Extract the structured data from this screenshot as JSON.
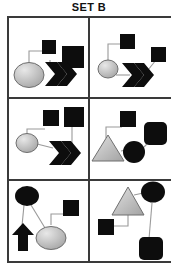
{
  "title": "SET B",
  "figure": {
    "type": "diagram",
    "grid": {
      "rows": 3,
      "columns": 2,
      "panel_count": 6
    },
    "colors": {
      "background": "#ffffff",
      "frame": "#3a3a3a",
      "shape_black": "#0d0d0d",
      "shape_gray": "#b4b4b4",
      "shape_gray_highlight": "#e6e6e6",
      "link": "#9a9a9a",
      "title_text": "#111111"
    },
    "panels": [
      {
        "id": "panel-1",
        "position": "top-left",
        "shapes": [
          {
            "name": "gray-circle",
            "shape": "circle",
            "fill": "gray"
          },
          {
            "name": "small-black-square",
            "shape": "square",
            "fill": "black",
            "size": "small"
          },
          {
            "name": "large-black-square",
            "shape": "square",
            "fill": "black",
            "size": "large"
          },
          {
            "name": "black-chevron",
            "shape": "chevron",
            "fill": "black"
          }
        ],
        "links": [
          {
            "from": "gray-circle",
            "to": "small-black-square",
            "style": "elbow"
          },
          {
            "from": "small-black-square",
            "to": "large-black-square",
            "style": "elbow"
          },
          {
            "from": "large-black-square",
            "to": "black-chevron",
            "style": "straight"
          }
        ]
      },
      {
        "id": "panel-2",
        "position": "top-right",
        "shapes": [
          {
            "name": "gray-circle",
            "shape": "circle",
            "fill": "gray"
          },
          {
            "name": "small-black-square-top",
            "shape": "square",
            "fill": "black",
            "size": "small"
          },
          {
            "name": "small-black-square-right",
            "shape": "square",
            "fill": "black",
            "size": "small"
          },
          {
            "name": "black-chevron",
            "shape": "chevron",
            "fill": "black"
          }
        ],
        "links": [
          {
            "from": "gray-circle",
            "to": "small-black-square-top",
            "style": "elbow"
          },
          {
            "from": "gray-circle",
            "to": "black-chevron",
            "style": "straight"
          },
          {
            "from": "black-chevron",
            "to": "small-black-square-right",
            "style": "straight"
          }
        ]
      },
      {
        "id": "panel-3",
        "position": "middle-left",
        "shapes": [
          {
            "name": "gray-circle",
            "shape": "circle",
            "fill": "gray"
          },
          {
            "name": "small-black-square",
            "shape": "square",
            "fill": "black",
            "size": "small"
          },
          {
            "name": "large-black-square",
            "shape": "square",
            "fill": "black",
            "size": "large"
          },
          {
            "name": "black-chevron",
            "shape": "chevron",
            "fill": "black"
          }
        ],
        "links": [
          {
            "from": "gray-circle",
            "to": "small-black-square",
            "style": "elbow"
          },
          {
            "from": "large-black-square",
            "to": "black-chevron",
            "style": "straight"
          },
          {
            "from": "gray-circle",
            "to": "black-chevron",
            "style": "straight"
          }
        ]
      },
      {
        "id": "panel-4",
        "position": "middle-right",
        "shapes": [
          {
            "name": "gray-triangle",
            "shape": "triangle",
            "fill": "gray"
          },
          {
            "name": "small-black-square",
            "shape": "square",
            "fill": "black",
            "size": "small"
          },
          {
            "name": "large-black-rounded-square",
            "shape": "rounded-square",
            "fill": "black",
            "size": "large"
          },
          {
            "name": "black-circle",
            "shape": "circle",
            "fill": "black"
          }
        ],
        "links": [
          {
            "from": "gray-triangle",
            "to": "small-black-square",
            "style": "elbow"
          },
          {
            "from": "gray-triangle",
            "to": "black-circle",
            "style": "straight"
          },
          {
            "from": "black-circle",
            "to": "large-black-rounded-square",
            "style": "straight"
          }
        ]
      },
      {
        "id": "panel-5",
        "position": "bottom-left",
        "shapes": [
          {
            "name": "black-circle",
            "shape": "circle",
            "fill": "black"
          },
          {
            "name": "black-up-arrow",
            "shape": "arrow-up",
            "fill": "black"
          },
          {
            "name": "gray-ellipse",
            "shape": "ellipse",
            "fill": "gray"
          },
          {
            "name": "small-black-square",
            "shape": "square",
            "fill": "black",
            "size": "small"
          }
        ],
        "links": [
          {
            "from": "black-circle",
            "to": "black-up-arrow",
            "style": "straight"
          },
          {
            "from": "black-circle",
            "to": "gray-ellipse",
            "style": "straight"
          },
          {
            "from": "gray-ellipse",
            "to": "small-black-square",
            "style": "elbow"
          }
        ]
      },
      {
        "id": "panel-6",
        "position": "bottom-right",
        "shapes": [
          {
            "name": "gray-triangle",
            "shape": "triangle",
            "fill": "gray"
          },
          {
            "name": "black-circle",
            "shape": "circle",
            "fill": "black"
          },
          {
            "name": "small-black-square",
            "shape": "square",
            "fill": "black",
            "size": "small"
          },
          {
            "name": "large-black-rounded-square",
            "shape": "rounded-square",
            "fill": "black",
            "size": "large"
          }
        ],
        "links": [
          {
            "from": "gray-triangle",
            "to": "black-circle",
            "style": "straight"
          },
          {
            "from": "gray-triangle",
            "to": "small-black-square",
            "style": "elbow"
          },
          {
            "from": "black-circle",
            "to": "large-black-rounded-square",
            "style": "straight"
          }
        ]
      }
    ]
  }
}
